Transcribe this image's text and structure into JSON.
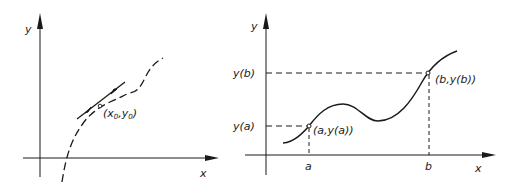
{
  "figure": {
    "left_panel": {
      "y_axis_label": "y",
      "x_axis_label": "x",
      "point_label_open": "(x",
      "point_sub_x": "0",
      "point_label_sep": ",y",
      "point_sub_y": "0",
      "point_label_close": ")",
      "curve_style": "dashed",
      "tangent_style": "solid"
    },
    "right_panel": {
      "y_axis_label": "y",
      "x_axis_label": "x",
      "tick_a": "a",
      "tick_b": "b",
      "y_tick_a": "y(a)",
      "y_tick_b": "y(b)",
      "point_a_label": "(a,y(a))",
      "point_b_label": "(b,y(b))",
      "curve_style": "solid",
      "guide_style": "dashed"
    },
    "colors": {
      "ink": "#1a1a1a",
      "background": "#ffffff"
    }
  }
}
